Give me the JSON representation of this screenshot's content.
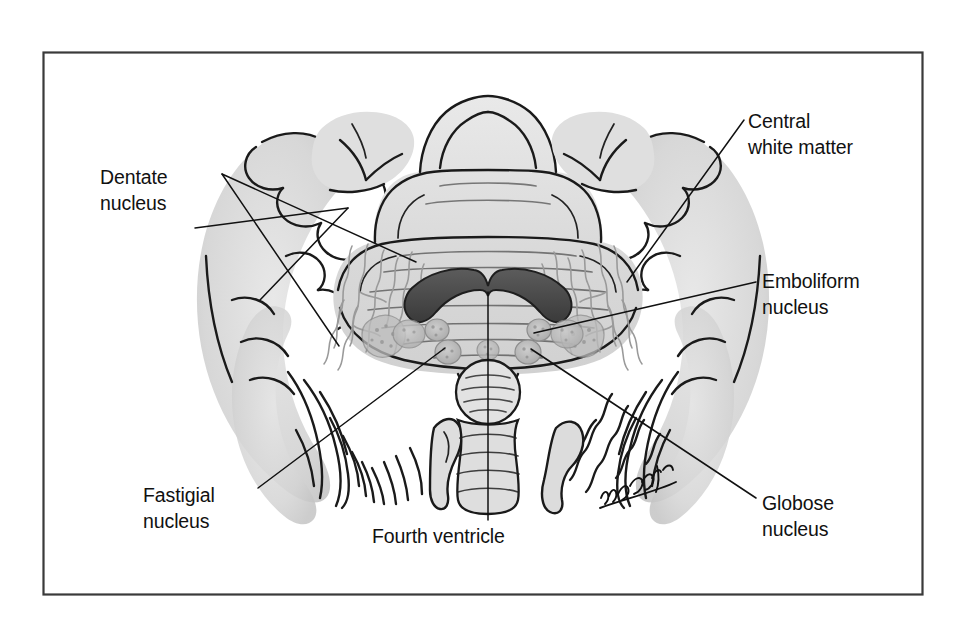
{
  "figure": {
    "medium": "pencil-and-ink anatomical illustration",
    "frame_color": "#3a3a3a",
    "background_color": "#ffffff",
    "ink_color": "#1a1a1a",
    "signature": "artist-signature"
  },
  "labels": [
    {
      "id": "dentate-nucleus",
      "line1": "Dentate",
      "line2": "nucleus",
      "align": "left",
      "text_x": 100,
      "text_y": 184,
      "position": "upper-left"
    },
    {
      "id": "central-white-matter",
      "line1": "Central",
      "line2": "white matter",
      "align": "left",
      "text_x": 748,
      "text_y": 128,
      "position": "upper-right"
    },
    {
      "id": "emboliform-nucleus",
      "line1": "Emboliform",
      "line2": "nucleus",
      "align": "left",
      "text_x": 762,
      "text_y": 288,
      "position": "middle-right"
    },
    {
      "id": "globose-nucleus",
      "line1": "Globose",
      "line2": "nucleus",
      "align": "left",
      "text_x": 762,
      "text_y": 510,
      "position": "lower-right"
    },
    {
      "id": "fastigial-nucleus",
      "line1": "Fastigial",
      "line2": "nucleus",
      "align": "left",
      "text_x": 143,
      "text_y": 502,
      "position": "lower-left"
    },
    {
      "id": "fourth-ventricle",
      "line1": "Fourth ventricle",
      "line2": "",
      "align": "left",
      "text_x": 372,
      "text_y": 543,
      "position": "bottom-center"
    }
  ],
  "structures": [
    {
      "id": "vermis-superior",
      "name": "superior vermis",
      "shading": "light-gray"
    },
    {
      "id": "vermis-inferior",
      "name": "inferior vermis / nodulus",
      "shading": "light-gray"
    },
    {
      "id": "cerebellar-hemisphere-left",
      "name": "left cerebellar hemisphere folia",
      "shading": "light-gray"
    },
    {
      "id": "cerebellar-hemisphere-right",
      "name": "right cerebellar hemisphere folia",
      "shading": "light-gray"
    },
    {
      "id": "dentate-nucleus-left",
      "name": "left dentate nucleus",
      "shading": "wavy-gray-band"
    },
    {
      "id": "dentate-nucleus-right",
      "name": "right dentate nucleus",
      "shading": "wavy-gray-band"
    },
    {
      "id": "fastigial-nucleus-body",
      "name": "fastigial nucleus",
      "shading": "dark-gray-arc"
    },
    {
      "id": "emboliform-nucleus-left",
      "name": "left emboliform nucleus",
      "shading": "stippled-gray"
    },
    {
      "id": "emboliform-nucleus-right",
      "name": "right emboliform nucleus",
      "shading": "stippled-gray"
    },
    {
      "id": "globose-nucleus-left",
      "name": "left globose nucleus",
      "shading": "stippled-gray"
    },
    {
      "id": "globose-nucleus-right",
      "name": "right globose nucleus",
      "shading": "stippled-gray"
    },
    {
      "id": "fourth-ventricle-body",
      "name": "fourth ventricle",
      "shading": "outline"
    }
  ]
}
